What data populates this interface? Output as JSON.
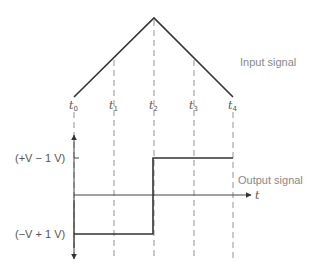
{
  "labels": {
    "input_signal": "Input signal",
    "output_signal": "Output signal",
    "t_axis": "t",
    "high_level": "(+V − 1 V)",
    "low_level": "(−V + 1 V)"
  },
  "time_markers": [
    {
      "base": "t",
      "sub": "0"
    },
    {
      "base": "t",
      "sub": "1"
    },
    {
      "base": "t",
      "sub": "2"
    },
    {
      "base": "t",
      "sub": "3"
    },
    {
      "base": "t",
      "sub": "4"
    }
  ],
  "colors": {
    "signal": "#333333",
    "axis": "#555555",
    "dashed": "#888888",
    "label": "#888888"
  }
}
